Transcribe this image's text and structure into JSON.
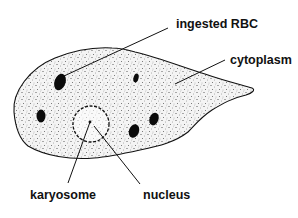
{
  "diagram": {
    "labels": {
      "ingested_rbc": "ingested RBC",
      "cytoplasm": "cytoplasm",
      "karyosome": "karyosome",
      "nucleus": "nucleus"
    },
    "colors": {
      "outline": "#111111",
      "stipple": "#555555",
      "rbc": "#0a0a0a",
      "background": "#ffffff"
    }
  }
}
